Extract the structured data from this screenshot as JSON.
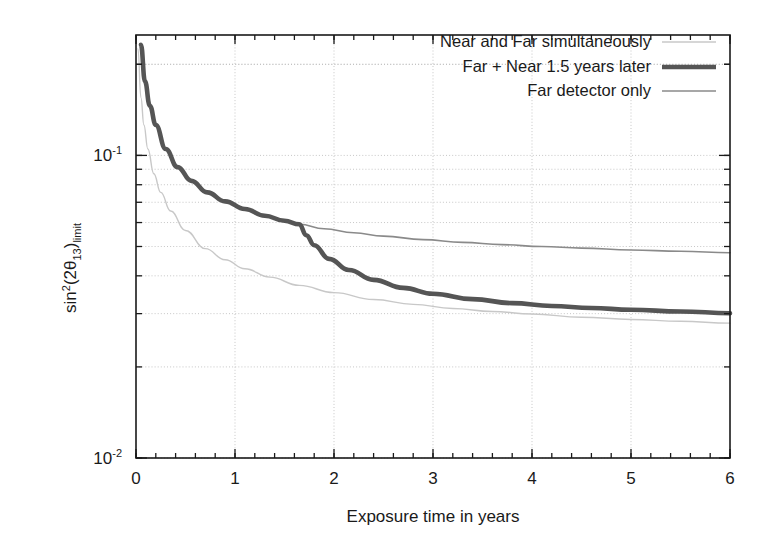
{
  "chart_data": {
    "type": "line",
    "title": "",
    "xlabel": "Exposure time in years",
    "ylabel": "sin^2(2theta_13)_limit",
    "ylabel_parts": {
      "base1": "sin",
      "sup1": "2",
      "mid": "(2θ",
      "sub1": "13",
      "close": ")",
      "sub2": "limit"
    },
    "xlim": [
      0,
      6
    ],
    "ylim": [
      0.01,
      0.25
    ],
    "yscale": "log",
    "grid": true,
    "grid_style": "dotted",
    "legend_position": "top-right-inside",
    "xticks": [
      0,
      1,
      2,
      3,
      4,
      5,
      6
    ],
    "xtick_labels": [
      "0",
      "1",
      "2",
      "3",
      "4",
      "5",
      "6"
    ],
    "xminor_step": 0.2,
    "yticks": [
      0.01,
      0.1
    ],
    "ytick_labels": [
      "10-2",
      "10-1"
    ],
    "yminor_ticks": [
      0.02,
      0.03,
      0.04,
      0.05,
      0.06,
      0.07,
      0.08,
      0.09,
      0.2
    ],
    "series": [
      {
        "name": "Near and Far simultaneously",
        "color": "#c8c8c8",
        "width": 1.4,
        "x": [
          0.02,
          0.05,
          0.08,
          0.12,
          0.18,
          0.25,
          0.35,
          0.5,
          0.7,
          0.9,
          1.1,
          1.35,
          1.65,
          2.0,
          2.4,
          2.8,
          3.2,
          3.6,
          4.0,
          4.5,
          5.0,
          5.5,
          6.0
        ],
        "y": [
          0.225,
          0.155,
          0.126,
          0.105,
          0.087,
          0.0755,
          0.0655,
          0.0565,
          0.0492,
          0.0452,
          0.0422,
          0.0396,
          0.0372,
          0.0352,
          0.0334,
          0.0322,
          0.0312,
          0.0305,
          0.0299,
          0.0292,
          0.0287,
          0.0283,
          0.0279
        ]
      },
      {
        "name": "Far + Near 1.5 years later",
        "color": "#555555",
        "width": 4.6,
        "kink_x": 1.65,
        "x": [
          0.05,
          0.09,
          0.14,
          0.2,
          0.3,
          0.42,
          0.56,
          0.72,
          0.9,
          1.1,
          1.3,
          1.5,
          1.65,
          1.72,
          1.8,
          1.95,
          2.15,
          2.4,
          2.7,
          3.0,
          3.4,
          3.8,
          4.2,
          4.6,
          5.0,
          5.5,
          6.0
        ],
        "y": [
          0.232,
          0.176,
          0.146,
          0.126,
          0.105,
          0.0915,
          0.0824,
          0.0755,
          0.0705,
          0.0665,
          0.0632,
          0.0608,
          0.0592,
          0.0545,
          0.0505,
          0.0455,
          0.0418,
          0.0388,
          0.0365,
          0.0349,
          0.0335,
          0.0325,
          0.0318,
          0.0313,
          0.0309,
          0.0305,
          0.0301
        ]
      },
      {
        "name": "Far detector only",
        "color": "#8a8a8a",
        "width": 1.6,
        "x": [
          0.05,
          0.09,
          0.14,
          0.2,
          0.3,
          0.42,
          0.56,
          0.72,
          0.9,
          1.1,
          1.3,
          1.5,
          1.65,
          1.9,
          2.2,
          2.5,
          2.9,
          3.3,
          3.7,
          4.1,
          4.5,
          5.0,
          5.5,
          6.0
        ],
        "y": [
          0.232,
          0.176,
          0.146,
          0.126,
          0.105,
          0.0915,
          0.0824,
          0.0755,
          0.0705,
          0.0665,
          0.0632,
          0.0608,
          0.0592,
          0.0572,
          0.0555,
          0.0541,
          0.0527,
          0.0516,
          0.0507,
          0.05,
          0.0494,
          0.0487,
          0.0482,
          0.0477
        ]
      }
    ],
    "legend": [
      {
        "label": "Near and Far simultaneously",
        "color": "#c8c8c8",
        "width": 1.4
      },
      {
        "label": "Far + Near 1.5 years later",
        "color": "#555555",
        "width": 4.6
      },
      {
        "label": "Far detector only",
        "color": "#8a8a8a",
        "width": 1.6
      }
    ]
  }
}
